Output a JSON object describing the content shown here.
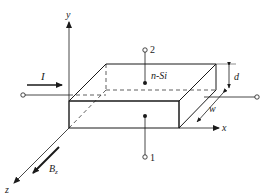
{
  "diagram": {
    "labels": {
      "y_axis": "y",
      "x_axis": "x",
      "z_axis": "z",
      "current": "I",
      "material": "n-Si",
      "thickness": "d",
      "width": "w",
      "field": "B",
      "field_sub": "z",
      "contact_top": "2",
      "contact_bottom": "1"
    },
    "colors": {
      "stroke": "#1a1a1a",
      "background": "#ffffff"
    }
  }
}
